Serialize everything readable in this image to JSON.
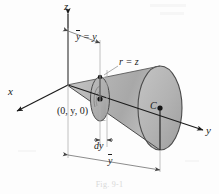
{
  "figure": {
    "caption": "Fig. 9-1",
    "background_color": "#fdfdfd",
    "ink_color": "#1b1b1b"
  },
  "axes": [
    {
      "name": "z-axis",
      "label": "z",
      "direction": "up"
    },
    {
      "name": "x-axis",
      "label": "x",
      "direction": "lower-left"
    },
    {
      "name": "y-axis",
      "label": "y",
      "direction": "lower-right"
    }
  ],
  "labels": {
    "z": "z",
    "x": "x",
    "y": "y",
    "y_bar_equals_y": {
      "bar_part": "y",
      "rest": " = y"
    },
    "r_equals_z": "r = z",
    "origin_point": "(0, y, 0)",
    "centroid": "C",
    "dy": "dy",
    "y_bar": "y"
  },
  "shape": {
    "type": "cone",
    "apex": "origin",
    "axis": "y-axis",
    "relation": "r = z",
    "fill_light": "#cfcfcf",
    "fill_mid": "#b9b9b9",
    "fill_dark": "#a3a3a3",
    "outline": "#3a3a3a"
  },
  "elements": [
    {
      "name": "differential-disk",
      "label": "dy",
      "position": "at y"
    },
    {
      "name": "disk-center-point",
      "label": "(0, y, 0)"
    },
    {
      "name": "base-disk",
      "label": "C"
    }
  ],
  "dimensions": [
    {
      "name": "y-bar-equals-y-dimension",
      "label": "y = y",
      "from": "z-axis",
      "to": "differential-disk"
    },
    {
      "name": "dy-dimension",
      "label": "dy",
      "span": "thickness of disk"
    },
    {
      "name": "y-bar-dimension",
      "label": "y",
      "from": "origin",
      "to": "base-disk"
    }
  ]
}
